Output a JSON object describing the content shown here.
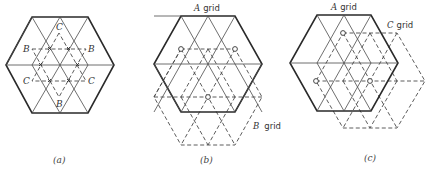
{
  "panels": [
    {
      "id": "a",
      "caption": "(a)",
      "site_labels": {
        "c_top": "C",
        "c_left": "C",
        "c_right": "C",
        "b_left": "B",
        "b_right": "B",
        "b_bottom": "B"
      }
    },
    {
      "id": "b",
      "caption": "(b)",
      "grid_labels": {
        "a_letter": "A",
        "a_word": "grid",
        "b_letter": "B",
        "b_word": "grid"
      }
    },
    {
      "id": "c",
      "caption": "(c)",
      "grid_labels": {
        "a_letter": "A",
        "a_word": "grid",
        "c_letter": "C",
        "c_word": "grid"
      }
    }
  ],
  "colors": {
    "line": "#2a2a2a",
    "background": "#ffffff"
  }
}
